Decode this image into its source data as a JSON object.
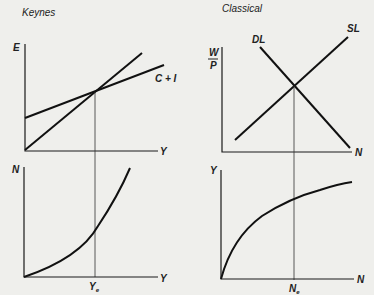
{
  "panels": {
    "keynes": {
      "title": "Keynes",
      "top": {
        "y_axis_label": "E",
        "x_axis_label": "Y",
        "curve_label": "C + I"
      },
      "bottom": {
        "y_axis_label": "N",
        "x_axis_label": "Y",
        "equilibrium_label_main": "Y",
        "equilibrium_label_sub": "e"
      }
    },
    "classical": {
      "title": "Classical",
      "top": {
        "y_axis_label_num": "W",
        "y_axis_label_den": "P",
        "x_axis_label": "N",
        "demand_label": "DL",
        "supply_label": "SL"
      },
      "bottom": {
        "y_axis_label": "Y",
        "x_axis_label": "N",
        "equilibrium_label_main": "N",
        "equilibrium_label_sub": "e"
      }
    }
  },
  "colors": {
    "background": "#efefec",
    "ink": "#111111"
  }
}
